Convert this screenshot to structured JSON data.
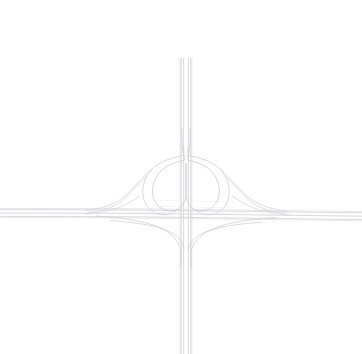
{
  "canvas": {
    "width": 362,
    "height": 354,
    "background": "#ffffff",
    "title": "Highway Interchange Diagram"
  },
  "palette": {
    "road_casing": "#d8d8de",
    "road_fill": "#fbfbfc",
    "lane_line": "#c9c9d1",
    "ramp_line": "#bfbfc8",
    "ramp_line_light": "#d6d6dd",
    "faint_line": "#e4e4e9"
  },
  "geometry": {
    "center_x": 186,
    "center_y": 213,
    "vertical_axis_x": 186,
    "horizontal_axis_y": 213,
    "vertical_top_y": 58,
    "vertical_bottom_y": 354,
    "horizontal_left_x": 0,
    "horizontal_right_x": 362,
    "loop_left_center_x": 165,
    "loop_left_center_y": 185,
    "loop_right_center_x": 208,
    "loop_right_center_y": 185,
    "loop_radius": 23
  },
  "layers": [
    {
      "id": "vertical-mainline",
      "name": "vertical-highway",
      "label": "North-South mainline carriageway",
      "orientation": "vertical",
      "lane_count": 4,
      "stroke": "#c9c9d1",
      "stroke_width": 0.7,
      "paths": [
        "M 181.2 58 L 181.2 354",
        "M 183.6 58 L 183.6 354",
        "M 188.4 58 L 188.4 354",
        "M 190.8 58 L 190.8 354"
      ]
    },
    {
      "id": "vertical-mainline-casing",
      "name": "vertical-highway-casing",
      "label": "North-South mainline outer casing",
      "orientation": "vertical",
      "stroke": "#e4e4e9",
      "stroke_width": 1.1,
      "paths": [
        "M 180.2 58 L 180.2 354",
        "M 191.8 58 L 191.8 354"
      ]
    },
    {
      "id": "horizontal-mainline",
      "name": "horizontal-highway",
      "label": "East-West mainline carriageway",
      "orientation": "horizontal",
      "lane_count": 3,
      "stroke": "#c9c9d1",
      "stroke_width": 0.7,
      "paths": [
        "M 0 209.6 L 120 209.9 L 186 210.6 L 250 211.4 L 362 212.8",
        "M 0 213.0 L 120 213.3 L 186 214.0 L 250 214.8 L 362 216.2",
        "M 0 216.4 L 120 216.7 L 186 217.4 L 250 218.2 L 362 219.6"
      ]
    },
    {
      "id": "horizontal-mainline-casing",
      "name": "horizontal-highway-casing",
      "label": "East-West mainline outer casing",
      "orientation": "horizontal",
      "stroke": "#e8e8ec",
      "stroke_width": 1.0,
      "paths": [
        "M 0 208.4 L 120 208.7 L 186 209.4 L 250 210.2 L 362 211.6",
        "M 0 217.6 L 120 217.9 L 186 218.6 L 250 219.4 L 362 220.8"
      ]
    },
    {
      "id": "loop-ramps-inner",
      "name": "inner-loop-ramps",
      "label": "Inner cloverleaf loop ramps (heart shape)",
      "stroke": "#c4c4cd",
      "stroke_width": 0.75,
      "paths": [
        "M 184.5 160 C 176 162 166 165 160 172 C 152 181 150 194 156 203 C 162 212 175 214 182 206 C 185.5 202 186 196 186 190 L 186 163",
        "M 187.5 160 C 196 162 206 165 212 172 C 220 181 222 194 216 203 C 210 212 197 214 190 206 C 186.5 202 186 196 186 190 L 186 163"
      ]
    },
    {
      "id": "loop-ramps-outer",
      "name": "outer-loop-ramps",
      "label": "Outer cloverleaf loop ramps",
      "stroke": "#cccbd4",
      "stroke_width": 0.75,
      "paths": [
        "M 183.6 155.5 C 173 157.5 160 161 152 169 C 142 179.5 140 196 147 206 C 153.5 215.5 168 218 177 210",
        "M 188.4 155.5 C 199 157.5 212 161 220 169 C 230 179.5 232 196 225 206 C 218.5 215.5 204 218 195 210"
      ]
    },
    {
      "id": "outer-connector-left",
      "name": "left-connector-ramps",
      "label": "Western connector ramps to east-west mainline",
      "stroke": "#cfcfd7",
      "stroke_width": 0.7,
      "paths": [
        "M 152 169 C 143 176 134 188 124 197 C 114 205 100 209 86 210.4",
        "M 147 176 C 139 183 131 193 122 201 C 113 208 100 211.4 88 212.6",
        "M 140 196 C 134 200 126 205 118 208 C 108 211.5 96 213.2 84 214"
      ]
    },
    {
      "id": "outer-connector-right",
      "name": "right-connector-ramps",
      "label": "Eastern connector ramps to east-west mainline",
      "stroke": "#cfcfd7",
      "stroke_width": 0.7,
      "paths": [
        "M 220 169 C 229 176 238 188 248 197 C 258 205 272 209.6 288 211.2",
        "M 225 176 C 233 183 241 193 250 201 C 259 208 272 212.2 286 213.6",
        "M 232 196 C 238 200 246 205 254 208 C 264 211.5 276 214.2 290 215.2"
      ]
    },
    {
      "id": "south-ramps",
      "name": "southbound-ramps",
      "label": "Ramps converging on the southern mainline",
      "stroke": "#cacad2",
      "stroke_width": 0.7,
      "paths": [
        "M 96 216 C 118 217.5 140 220 156 226 C 170 231.5 178 239 181 250 L 181 268",
        "M 276 217.6 C 254 219 232 221.6 216 227.6 C 202 233 194 240.5 191 251 L 191 268",
        "M 110 220.6 C 132 222 152 224.6 166 230 C 177 234.5 182.4 240.5 184 249",
        "M 262 222.2 C 240 223.6 220 226.4 206 231.8 C 195 236.4 189.6 242 188 250"
      ]
    },
    {
      "id": "north-merge",
      "name": "northbound-merge-ramps",
      "label": "Loop ramps merging into the northern mainline",
      "stroke": "#cacad2",
      "stroke_width": 0.7,
      "paths": [
        "M 183.6 155.5 C 182.6 151 182 145 182 140 L 182 128",
        "M 188.4 155.5 C 189.4 151 190 145 190 140 L 190 128",
        "M 184.5 160 C 184 156 183.6 151 183.6 147",
        "M 187.5 160 C 188 156 188.4 151 188.4 147"
      ]
    },
    {
      "id": "crossing-faint",
      "name": "crossing-overpass-shadow",
      "label": "Faint overpass crossing marks",
      "stroke": "#ededf1",
      "stroke_width": 0.6,
      "paths": [
        "M 152 206 L 232 208",
        "M 150 200 L 234 202",
        "M 128 212 L 250 214"
      ]
    }
  ],
  "features": [
    {
      "id": "feature-vertical",
      "name": "north-south-motorway",
      "type": "motorway",
      "description": "Vertical dual carriageway running top to bottom through the frame"
    },
    {
      "id": "feature-horizontal",
      "name": "east-west-motorway",
      "type": "motorway",
      "description": "Horizontal carriageway running left to right, slightly inclined"
    },
    {
      "id": "feature-loops",
      "name": "cloverleaf-loop-pair",
      "type": "loop-ramp",
      "description": "Two mirrored loop ramps forming a heart/clover outline north of the crossing"
    },
    {
      "id": "feature-connectors",
      "name": "directional-connector-ramps",
      "type": "connector-ramp",
      "description": "Flared connector ramps joining the loops to the east-west carriageway"
    }
  ]
}
